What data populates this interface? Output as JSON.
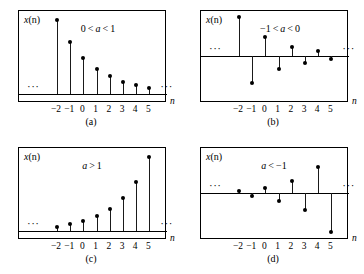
{
  "figure": {
    "ticks": [
      "−2",
      "−1",
      "0",
      "1",
      "2",
      "3",
      "4",
      "5"
    ],
    "axis_label": "n",
    "y_axis_label_var": "x",
    "y_axis_label_arg": "(n)",
    "ellipsis": "···"
  },
  "chart_data": {
    "type": "line",
    "xlabel": "n",
    "ylabel": "x(n)",
    "x": [
      -2,
      -1,
      0,
      1,
      2,
      3,
      4,
      5
    ],
    "xlim": [
      -2.8,
      5.9
    ],
    "grid": false,
    "legend": "none",
    "panels": [
      {
        "id": "a",
        "caption": "(a)",
        "condition": "0 < a < 1",
        "condition_parts": {
          "lower": "0",
          "rel1": "<",
          "var": "a",
          "rel2": "<",
          "upper": "1"
        },
        "description": "decaying positive exponential, a = 0.7",
        "a": 0.7,
        "baseline": "bottom",
        "values": [
          2.04,
          1.43,
          1.0,
          0.7,
          0.49,
          0.343,
          0.24,
          0.168
        ],
        "ylim": [
          0,
          2.4
        ],
        "ellipsis_left": true,
        "ellipsis_right": true
      },
      {
        "id": "b",
        "caption": "(b)",
        "condition": "−1 < a < 0",
        "condition_parts": {
          "lower": "−1",
          "rel1": "<",
          "var": "a",
          "rel2": "<",
          "upper": "0"
        },
        "description": "alternating decaying exponential, a = −0.7",
        "a": -0.7,
        "baseline": "middle",
        "values": [
          2.04,
          -1.43,
          1.0,
          -0.7,
          0.49,
          -0.343,
          0.24,
          -0.168
        ],
        "ylim": [
          -2.4,
          2.4
        ],
        "ellipsis_left": true,
        "ellipsis_right": true
      },
      {
        "id": "c",
        "caption": "(c)",
        "condition": "a > 1",
        "condition_parts": {
          "var": "a",
          "rel1": ">",
          "upper": "1"
        },
        "description": "growing positive exponential, a = 1.5",
        "a": 1.5,
        "baseline": "bottom",
        "values": [
          0.444,
          0.667,
          1.0,
          1.5,
          2.25,
          3.375,
          5.06,
          7.59
        ],
        "ylim": [
          0,
          8.4
        ],
        "ellipsis_left": true,
        "ellipsis_right": true
      },
      {
        "id": "d",
        "caption": "(d)",
        "condition": "a < −1",
        "condition_parts": {
          "var": "a",
          "rel1": "<",
          "upper": "−1"
        },
        "description": "alternating growing exponential, a = −1.5",
        "a": -1.5,
        "baseline": "middle",
        "values": [
          0.444,
          -0.667,
          1.0,
          -1.5,
          2.25,
          -3.375,
          5.06,
          -7.59
        ],
        "ylim": [
          -8.4,
          8.4
        ],
        "ellipsis_left": true,
        "ellipsis_right": true
      }
    ]
  }
}
